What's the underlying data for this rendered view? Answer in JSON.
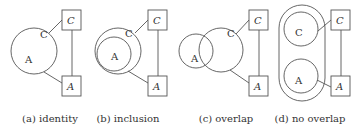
{
  "figure": {
    "panels": [
      {
        "id": "a",
        "caption": "(a) identity",
        "circle_labels": {
          "c": "C",
          "a": "A"
        },
        "box_labels": {
          "top": "C",
          "bottom": "A"
        }
      },
      {
        "id": "b",
        "caption": "(b) inclusion",
        "circle_labels": {
          "c": "C",
          "a": "A"
        },
        "box_labels": {
          "top": "C",
          "bottom": "A"
        }
      },
      {
        "id": "c",
        "caption": "(c) overlap",
        "circle_labels": {
          "c": "C",
          "a": "A"
        },
        "box_labels": {
          "top": "C",
          "bottom": "A"
        }
      },
      {
        "id": "d",
        "caption": "(d) no overlap",
        "circle_labels": {
          "c": "C",
          "a": "A"
        },
        "box_labels": {
          "top": "C",
          "bottom": "A"
        }
      }
    ],
    "colors": {
      "stroke": "#555555",
      "text": "#333333",
      "background": "#ffffff"
    }
  }
}
